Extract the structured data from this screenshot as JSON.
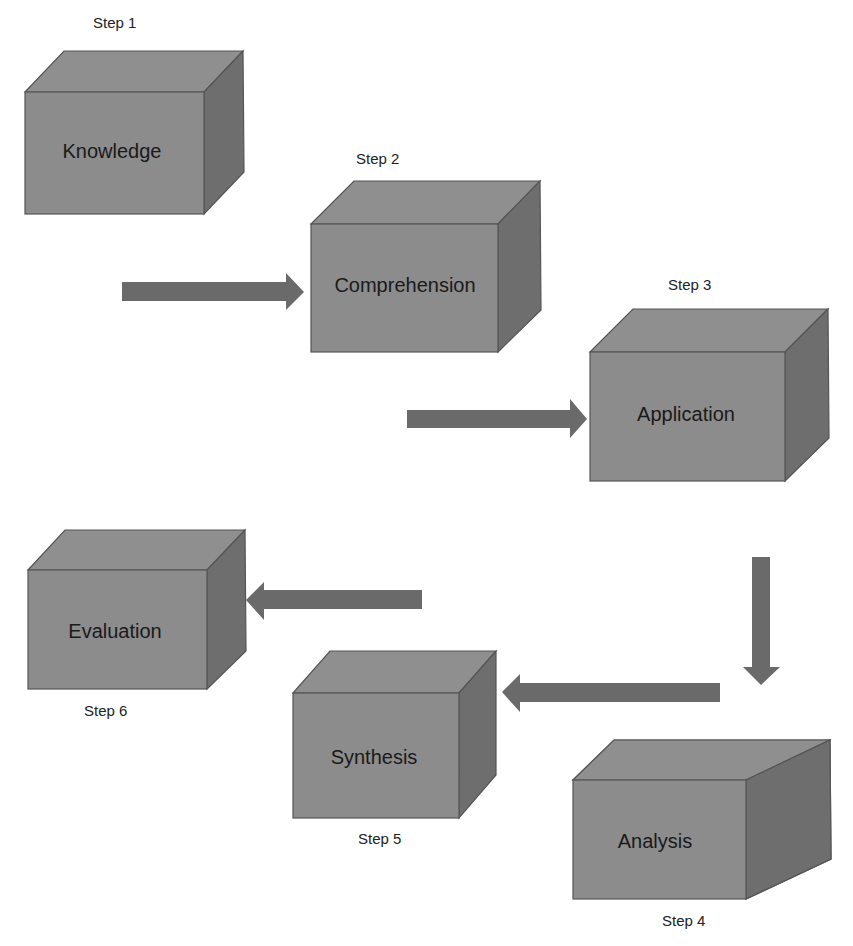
{
  "diagram": {
    "title": "",
    "colors": {
      "box_front": "#8c8c8c",
      "box_top": "#8f8f8f",
      "box_side": "#6e6e6e",
      "arrow": "#6a6a6a",
      "text": "#1a1a1a"
    },
    "steps": [
      {
        "step_label": "Step 1",
        "box_label": "Knowledge"
      },
      {
        "step_label": "Step 2",
        "box_label": "Comprehension"
      },
      {
        "step_label": "Step 3",
        "box_label": "Application"
      },
      {
        "step_label": "Step 4",
        "box_label": "Analysis"
      },
      {
        "step_label": "Step 5",
        "box_label": "Synthesis"
      },
      {
        "step_label": "Step 6",
        "box_label": "Evaluation"
      }
    ],
    "arrows": [
      {
        "from": "Knowledge",
        "to": "Comprehension",
        "direction": "right"
      },
      {
        "from": "Comprehension",
        "to": "Application",
        "direction": "right"
      },
      {
        "from": "Application",
        "to": "Analysis",
        "direction": "down"
      },
      {
        "from": "Analysis",
        "to": "Synthesis",
        "direction": "left"
      },
      {
        "from": "Synthesis",
        "to": "Evaluation",
        "direction": "left"
      }
    ]
  }
}
